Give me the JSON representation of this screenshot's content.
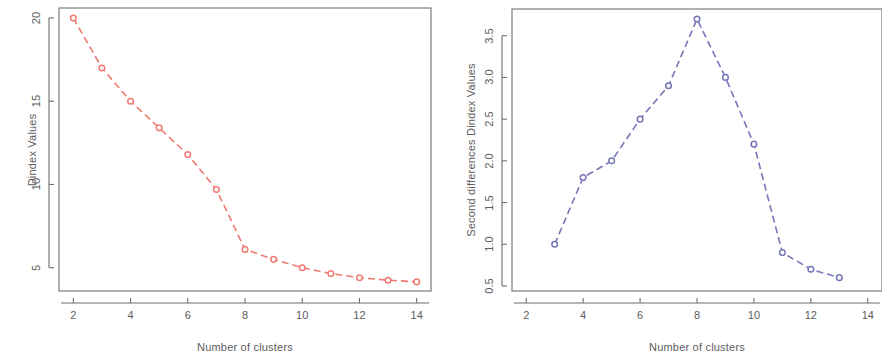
{
  "figure": {
    "width": 882,
    "height": 360,
    "background": "#ffffff",
    "panel_count": 2
  },
  "chart_data": [
    {
      "id": "dindex-values",
      "type": "line",
      "title": "",
      "xlabel": "Number of clusters",
      "ylabel": "Dindex Values",
      "x": [
        2,
        3,
        4,
        5,
        6,
        7,
        8,
        9,
        10,
        11,
        12,
        13,
        14
      ],
      "values": [
        20.0,
        17.0,
        15.0,
        13.4,
        11.8,
        9.7,
        6.1,
        5.5,
        5.0,
        4.65,
        4.4,
        4.25,
        4.15
      ],
      "series": [
        {
          "name": "Dindex Values",
          "values": [
            20.0,
            17.0,
            15.0,
            13.4,
            11.8,
            9.7,
            6.1,
            5.5,
            5.0,
            4.65,
            4.4,
            4.25,
            4.15
          ]
        }
      ],
      "xticks": [
        2,
        4,
        6,
        8,
        10,
        12,
        14
      ],
      "xtick_labels": [
        "2",
        "4",
        "6",
        "8",
        "10",
        "12",
        "14"
      ],
      "yticks": [
        5,
        10,
        15,
        20
      ],
      "ytick_labels": [
        "5",
        "10",
        "15",
        "20"
      ],
      "xlim": [
        1.5,
        14.5
      ],
      "ylim": [
        3.6,
        20.6
      ],
      "grid": false,
      "legend": false,
      "line_color": "#ef7b73",
      "marker_color": "#ef7b73",
      "marker": "circle-open",
      "line_style": "dashed",
      "box_color": "#6e6e6e"
    },
    {
      "id": "second-differences-dindex-values",
      "type": "line",
      "title": "",
      "xlabel": "Number of clusters",
      "ylabel": "Second differences Dindex Values",
      "x": [
        3,
        4,
        5,
        6,
        7,
        8,
        9,
        10,
        11,
        12,
        13
      ],
      "values": [
        1.0,
        1.8,
        2.0,
        2.5,
        2.9,
        3.7,
        3.0,
        2.2,
        0.9,
        0.7,
        0.6
      ],
      "series": [
        {
          "name": "Second differences Dindex Values",
          "values": [
            1.0,
            1.8,
            2.0,
            2.5,
            2.9,
            3.7,
            3.0,
            2.2,
            0.9,
            0.7,
            0.6
          ]
        }
      ],
      "xticks": [
        2,
        4,
        6,
        8,
        10,
        12,
        14
      ],
      "xtick_labels": [
        "2",
        "4",
        "6",
        "8",
        "10",
        "12",
        "14"
      ],
      "yticks": [
        0.5,
        1.0,
        1.5,
        2.0,
        2.5,
        3.0,
        3.5
      ],
      "ytick_labels": [
        "0.5",
        "1.0",
        "1.5",
        "2.0",
        "2.5",
        "3.0",
        "3.5"
      ],
      "xlim": [
        1.5,
        14.5
      ],
      "ylim": [
        0.44,
        3.82
      ],
      "grid": false,
      "legend": false,
      "line_color": "#7676b8",
      "marker_color": "#7676b8",
      "marker": "circle-open",
      "line_style": "dashed",
      "box_color": "#6e6e6e"
    }
  ]
}
